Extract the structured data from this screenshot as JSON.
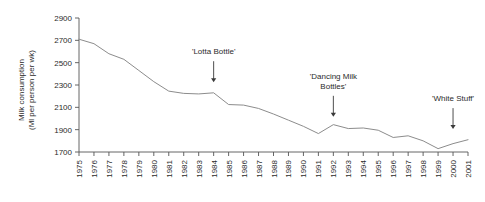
{
  "chart_data": {
    "type": "line",
    "title": "",
    "xlabel": "",
    "ylabel": "Milk consumption (Ml per person per wk)",
    "ylabel_line1": "Milk consumption",
    "ylabel_line2": "(Ml per person per wk)",
    "ylim": [
      1700,
      2900
    ],
    "ytick_step": 200,
    "yticks": [
      1700,
      1900,
      2100,
      2300,
      2500,
      2700,
      2900
    ],
    "ytick_labels": [
      "1700",
      "1900",
      "2100",
      "2300",
      "2500",
      "2700",
      "2900"
    ],
    "xlim": [
      1975,
      2001
    ],
    "categories": [
      "1975",
      "1976",
      "1977",
      "1978",
      "1979",
      "1980",
      "1981",
      "1982",
      "1983",
      "1984",
      "1985",
      "1986",
      "1987",
      "1988",
      "1989",
      "1990",
      "1991",
      "1992",
      "1993",
      "1994",
      "1995",
      "1996",
      "1997",
      "1998",
      "1999",
      "2000",
      "2001"
    ],
    "x": [
      1975,
      1976,
      1977,
      1978,
      1979,
      1980,
      1981,
      1982,
      1983,
      1984,
      1985,
      1986,
      1987,
      1988,
      1989,
      1990,
      1991,
      1992,
      1993,
      1994,
      1995,
      1996,
      1997,
      1998,
      1999,
      2000,
      2001
    ],
    "values": [
      2710,
      2670,
      2580,
      2530,
      2430,
      2330,
      2245,
      2225,
      2220,
      2230,
      2125,
      2120,
      2090,
      2040,
      1985,
      1930,
      1865,
      1945,
      1910,
      1915,
      1895,
      1830,
      1845,
      1800,
      1730,
      1775,
      1810
    ],
    "series": [
      {
        "name": "Milk consumption",
        "values": [
          2710,
          2670,
          2580,
          2530,
          2430,
          2330,
          2245,
          2225,
          2220,
          2230,
          2125,
          2120,
          2090,
          2040,
          1985,
          1930,
          1865,
          1945,
          1910,
          1915,
          1895,
          1830,
          1845,
          1800,
          1730,
          1775,
          1810
        ]
      }
    ],
    "grid": false,
    "legend": "none",
    "line_color": "#8c8c8c",
    "annotations": [
      {
        "text": "'Lotta Bottle'",
        "lines": [
          "'Lotta Bottle'"
        ],
        "x": 1984,
        "point_value": 2230,
        "arrow_tip_value": 2325
      },
      {
        "text": "'Dancing Milk Bottles'",
        "lines": [
          "'Dancing Milk",
          "Bottles'"
        ],
        "x": 1992,
        "point_value": 1945,
        "arrow_tip_value": 2015
      },
      {
        "text": "'White Stuff'",
        "lines": [
          "'White Stuff'"
        ],
        "x": 2000,
        "point_value": 1775,
        "arrow_tip_value": 1905
      }
    ]
  }
}
